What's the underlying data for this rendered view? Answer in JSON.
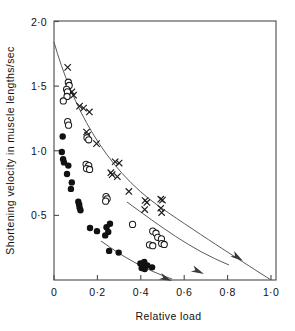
{
  "chart_data": {
    "type": "scatter",
    "title": "",
    "xlabel": "Relative load",
    "ylabel": "Shortening velocity in muscle lengths/sec",
    "xlim": [
      0,
      1.0
    ],
    "ylim": [
      0,
      2.0
    ],
    "grid": false,
    "legend_position": "none",
    "xticks": [
      0,
      0.2,
      0.4,
      0.6,
      0.8,
      1.0
    ],
    "xtick_labels": [
      "0",
      "0·2",
      "0·4",
      "0·6",
      "0·8",
      "1·0"
    ],
    "yticks": [
      0.5,
      1.0,
      1.5,
      2.0
    ],
    "ytick_labels": [
      "0·5",
      "1·0",
      "1·5",
      "2·0"
    ],
    "series": [
      {
        "name": "cross-series",
        "marker": "cross",
        "points": [
          [
            0.063,
            1.645
          ],
          [
            0.082,
            1.455
          ],
          [
            0.09,
            1.43
          ],
          [
            0.118,
            1.345
          ],
          [
            0.136,
            1.33
          ],
          [
            0.163,
            1.3
          ],
          [
            0.15,
            1.145
          ],
          [
            0.155,
            1.12
          ],
          [
            0.196,
            1.055
          ],
          [
            0.282,
            0.915
          ],
          [
            0.3,
            0.905
          ],
          [
            0.262,
            0.83
          ],
          [
            0.268,
            0.815
          ],
          [
            0.292,
            0.8
          ],
          [
            0.345,
            0.685
          ],
          [
            0.42,
            0.615
          ],
          [
            0.428,
            0.6
          ],
          [
            0.418,
            0.545
          ],
          [
            0.492,
            0.625
          ],
          [
            0.5,
            0.618
          ],
          [
            0.492,
            0.555
          ],
          [
            0.496,
            0.522
          ]
        ]
      },
      {
        "name": "open-circle-series",
        "marker": "open-circle",
        "points": [
          [
            0.066,
            1.53
          ],
          [
            0.07,
            1.505
          ],
          [
            0.058,
            1.475
          ],
          [
            0.062,
            1.455
          ],
          [
            0.06,
            1.42
          ],
          [
            0.043,
            1.385
          ],
          [
            0.063,
            1.225
          ],
          [
            0.067,
            1.198
          ],
          [
            0.152,
            1.1
          ],
          [
            0.16,
            1.085
          ],
          [
            0.148,
            0.895
          ],
          [
            0.16,
            0.885
          ],
          [
            0.15,
            0.862
          ],
          [
            0.164,
            0.855
          ],
          [
            0.24,
            0.645
          ],
          [
            0.245,
            0.628
          ],
          [
            0.238,
            0.61
          ],
          [
            0.362,
            0.43
          ],
          [
            0.455,
            0.378
          ],
          [
            0.47,
            0.362
          ],
          [
            0.478,
            0.33
          ],
          [
            0.495,
            0.318
          ],
          [
            0.44,
            0.272
          ],
          [
            0.455,
            0.265
          ],
          [
            0.496,
            0.282
          ],
          [
            0.508,
            0.275
          ]
        ]
      },
      {
        "name": "filled-circle-series",
        "marker": "filled-circle",
        "points": [
          [
            0.04,
            1.11
          ],
          [
            0.036,
            0.99
          ],
          [
            0.042,
            0.935
          ],
          [
            0.046,
            0.91
          ],
          [
            0.066,
            0.885
          ],
          [
            0.06,
            0.82
          ],
          [
            0.082,
            0.755
          ],
          [
            0.078,
            0.705
          ],
          [
            0.112,
            0.605
          ],
          [
            0.116,
            0.585
          ],
          [
            0.118,
            0.56
          ],
          [
            0.122,
            0.54
          ],
          [
            0.166,
            0.402
          ],
          [
            0.198,
            0.378
          ],
          [
            0.242,
            0.408
          ],
          [
            0.25,
            0.372
          ],
          [
            0.258,
            0.435
          ],
          [
            0.236,
            0.345
          ],
          [
            0.254,
            0.225
          ],
          [
            0.298,
            0.212
          ],
          [
            0.398,
            0.128
          ],
          [
            0.408,
            0.118
          ],
          [
            0.416,
            0.14
          ],
          [
            0.43,
            0.112
          ],
          [
            0.404,
            0.092
          ],
          [
            0.418,
            0.085
          ],
          [
            0.452,
            0.098
          ]
        ]
      }
    ],
    "curves": [
      {
        "name": "upper-curve",
        "description": "force-velocity hyperbola through cross series",
        "start": [
          0.0,
          1.85
        ],
        "end": [
          1.0,
          0.0
        ],
        "arrow": true
      },
      {
        "name": "middle-curve",
        "description": "force-velocity hyperbola through open circle series",
        "start": [
          0.335,
          0.6
        ],
        "end": [
          0.8,
          0.02
        ],
        "arrow": true
      },
      {
        "name": "lower-curve",
        "description": "force-velocity hyperbola through filled circle series",
        "start": [
          0.215,
          0.3
        ],
        "end": [
          0.545,
          0.0
        ],
        "arrow": true
      }
    ]
  }
}
